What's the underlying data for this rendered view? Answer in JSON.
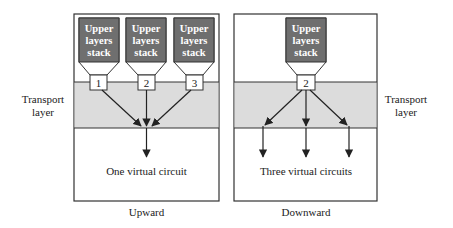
{
  "colors": {
    "stack_fill": "#6f6f6f",
    "band_fill": "#dcdcdc",
    "stroke": "#333333",
    "panel_fill": "#ffffff"
  },
  "left_panel": {
    "caption": "Upward",
    "circuit_label": "One virtual circuit",
    "stacks": [
      {
        "line1": "Upper",
        "line2": "layers",
        "line3": "stack",
        "port": "1"
      },
      {
        "line1": "Upper",
        "line2": "layers",
        "line3": "stack",
        "port": "2"
      },
      {
        "line1": "Upper",
        "line2": "layers",
        "line3": "stack",
        "port": "3"
      }
    ]
  },
  "right_panel": {
    "caption": "Downward",
    "circuit_label": "Three virtual circuits",
    "stacks": [
      {
        "line1": "Upper",
        "line2": "layers",
        "line3": "stack",
        "port": "2"
      }
    ]
  },
  "side_labels": {
    "left": {
      "line1": "Transport",
      "line2": "layer"
    },
    "right": {
      "line1": "Transport",
      "line2": "layer"
    }
  }
}
